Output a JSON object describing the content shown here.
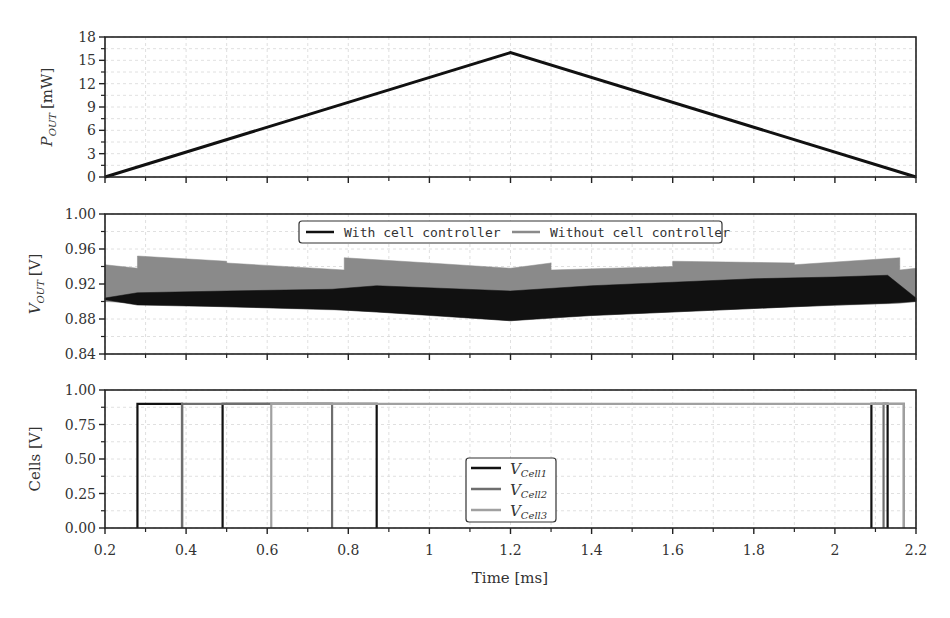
{
  "chart_data": [
    {
      "type": "line",
      "panel": "top",
      "ylabel": "P_OUT [mW]",
      "ylabel_main": "P",
      "ylabel_sub": "OUT",
      "ylabel_unit": "[mW]",
      "xlim": [
        0.2,
        2.2
      ],
      "ylim": [
        0,
        18
      ],
      "yticks": [
        0,
        3,
        6,
        9,
        12,
        15,
        18
      ],
      "ytick_labels": [
        "0",
        "3",
        "6",
        "9",
        "12",
        "15",
        "18"
      ],
      "grid": true,
      "series": [
        {
          "name": "P_OUT",
          "color": "#111111",
          "x": [
            0.2,
            1.2,
            2.2
          ],
          "y": [
            0,
            16,
            0
          ]
        }
      ]
    },
    {
      "type": "area",
      "panel": "middle",
      "ylabel": "V_OUT [V]",
      "ylabel_main": "V",
      "ylabel_sub": "OUT",
      "ylabel_unit": "[V]",
      "xlim": [
        0.2,
        2.2
      ],
      "ylim": [
        0.84,
        1.0
      ],
      "yticks": [
        0.84,
        0.88,
        0.92,
        0.96,
        1.0
      ],
      "ytick_labels": [
        "0.84",
        "0.88",
        "0.92",
        "0.96",
        "1.00"
      ],
      "grid": true,
      "legend": {
        "position": "upper center",
        "entries": [
          {
            "label": "With cell controller",
            "color": "#111111"
          },
          {
            "label": "Without cell controller",
            "color": "#8a8a8a"
          }
        ]
      },
      "series": [
        {
          "name": "Without cell controller",
          "color": "#8a8a8a",
          "x": [
            0.2,
            0.28,
            0.28,
            0.5,
            0.5,
            0.79,
            0.79,
            1.0,
            1.2,
            1.3,
            1.3,
            1.6,
            1.6,
            1.9,
            1.9,
            2.16,
            2.16,
            2.2
          ],
          "upper": [
            0.942,
            0.938,
            0.952,
            0.946,
            0.944,
            0.936,
            0.95,
            0.944,
            0.938,
            0.944,
            0.936,
            0.94,
            0.946,
            0.944,
            0.942,
            0.95,
            0.936,
            0.938
          ],
          "lower": [
            0.9,
            0.898,
            0.898,
            0.894,
            0.894,
            0.89,
            0.89,
            0.885,
            0.878,
            0.882,
            0.882,
            0.888,
            0.888,
            0.894,
            0.894,
            0.898,
            0.898,
            0.9
          ]
        },
        {
          "name": "With cell controller",
          "color": "#111111",
          "x": [
            0.2,
            0.28,
            0.5,
            0.76,
            0.87,
            1.2,
            1.4,
            1.6,
            1.8,
            2.0,
            2.13,
            2.2
          ],
          "upper": [
            0.904,
            0.91,
            0.912,
            0.914,
            0.918,
            0.912,
            0.918,
            0.922,
            0.926,
            0.928,
            0.93,
            0.904
          ],
          "lower": [
            0.902,
            0.896,
            0.894,
            0.891,
            0.888,
            0.878,
            0.884,
            0.888,
            0.892,
            0.896,
            0.898,
            0.9
          ]
        }
      ]
    },
    {
      "type": "line",
      "panel": "bottom",
      "ylabel": "Cells [V]",
      "xlabel": "Time [ms]",
      "xlim": [
        0.2,
        2.2
      ],
      "ylim": [
        0,
        1.0
      ],
      "xticks": [
        0.2,
        0.4,
        0.6,
        0.8,
        1.0,
        1.2,
        1.4,
        1.6,
        1.8,
        2.0,
        2.2
      ],
      "xtick_labels": [
        "0.2",
        "0.4",
        "0.6",
        "0.8",
        "1",
        "1.2",
        "1.4",
        "1.6",
        "1.8",
        "2",
        "2.2"
      ],
      "yticks": [
        0,
        0.25,
        0.5,
        0.75,
        1.0
      ],
      "ytick_labels": [
        "0.00",
        "0.25",
        "0.50",
        "0.75",
        "1.00"
      ],
      "grid": true,
      "legend": {
        "position": "lower center",
        "entries": [
          {
            "label": "V_Cell1",
            "main": "V",
            "sub": "Cell1",
            "color": "#111111"
          },
          {
            "label": "V_Cell2",
            "main": "V",
            "sub": "Cell2",
            "color": "#6e6e6e"
          },
          {
            "label": "V_Cell3",
            "main": "V",
            "sub": "Cell3",
            "color": "#a0a0a0"
          }
        ]
      },
      "series": [
        {
          "name": "V_Cell1",
          "color": "#111111",
          "level": 0.9,
          "transitions": [
            0.28,
            0.39,
            0.49,
            0.87,
            2.09,
            2.13
          ]
        },
        {
          "name": "V_Cell2",
          "color": "#6e6e6e",
          "level": 0.9,
          "transitions": [
            0.39,
            0.76,
            2.12,
            2.17
          ]
        },
        {
          "name": "V_Cell3",
          "color": "#a0a0a0",
          "level": 0.9,
          "transitions": [
            0.61,
            2.17
          ]
        }
      ]
    }
  ],
  "labels": {
    "p_main": "P",
    "p_sub": "OUT",
    "p_unit": "[mW]",
    "v_main": "V",
    "v_sub": "OUT",
    "v_unit": "[V]",
    "cells": "Cells [V]",
    "time": "Time [ms]",
    "legend_with": "With cell controller",
    "legend_without": "Without cell controller",
    "cell1_main": "V",
    "cell1_sub": "Cell1",
    "cell2_main": "V",
    "cell2_sub": "Cell2",
    "cell3_main": "V",
    "cell3_sub": "Cell3"
  }
}
